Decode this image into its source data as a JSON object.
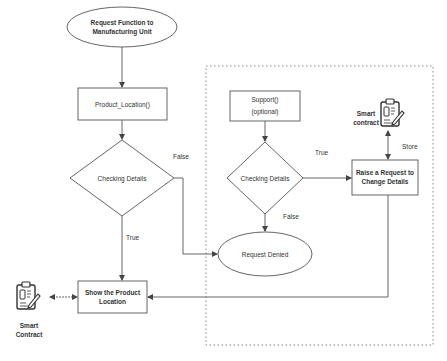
{
  "diagram": {
    "colors": {
      "stroke": "#555555",
      "text": "#333333",
      "dotted_border": "#888888",
      "background": "#ffffff"
    },
    "nodes": {
      "start": {
        "line1": "Request Function to",
        "line2": "Manufacturing Unit",
        "shape": "ellipse"
      },
      "product_location": {
        "label": "Product_Location()",
        "shape": "rectangle"
      },
      "check_left": {
        "label": "Checking Details",
        "shape": "diamond"
      },
      "show_location": {
        "line1": "Show the Product",
        "line2": "Location",
        "shape": "rectangle"
      },
      "support": {
        "line1": "Support()",
        "line2": "(optional)",
        "shape": "rectangle"
      },
      "check_right": {
        "label": "Checking Details",
        "shape": "diamond"
      },
      "request_denied": {
        "label": "Request Denied",
        "shape": "ellipse"
      },
      "raise_request": {
        "line1": "Raise a Request to",
        "line2": "Change Details",
        "shape": "rectangle"
      },
      "smart_contract_left": {
        "line1": "Smart",
        "line2": "Contract",
        "icon": "clipboard-contract-icon"
      },
      "smart_contract_right": {
        "line1": "Smart",
        "line2": "contract",
        "icon": "clipboard-contract-icon"
      }
    },
    "edge_labels": {
      "left_false": "False",
      "left_true": "True",
      "right_true": "True",
      "right_false": "False",
      "store": "Store"
    },
    "edges": [
      {
        "from": "start",
        "to": "product_location"
      },
      {
        "from": "product_location",
        "to": "check_left"
      },
      {
        "from": "check_left",
        "to": "show_location",
        "label": "True"
      },
      {
        "from": "check_left",
        "to": "request_denied",
        "label": "False"
      },
      {
        "from": "support",
        "to": "check_right"
      },
      {
        "from": "check_right",
        "to": "raise_request",
        "label": "True"
      },
      {
        "from": "check_right",
        "to": "request_denied",
        "label": "False"
      },
      {
        "from": "raise_request",
        "to": "smart_contract_right",
        "label": "Store",
        "bidirectional": true
      },
      {
        "from": "raise_request",
        "to": "show_location"
      },
      {
        "from": "smart_contract_left",
        "to": "show_location",
        "bidirectional": true
      }
    ]
  }
}
